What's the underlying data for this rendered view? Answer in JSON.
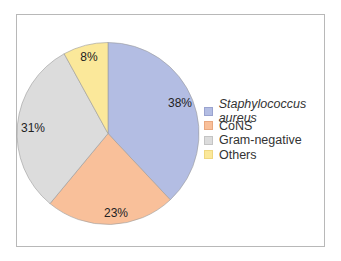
{
  "chart_data": {
    "type": "pie",
    "title": "",
    "categories": [
      "Staphylococcus aureus",
      "CoNS",
      "Gram-negative",
      "Others"
    ],
    "values": [
      38,
      23,
      31,
      8
    ],
    "labels": [
      "38%",
      "23%",
      "31%",
      "8%"
    ],
    "colors": [
      "#b3bde3",
      "#f9c09a",
      "#dcdcdc",
      "#fbe89a"
    ],
    "legend_position": "right",
    "start_angle": "12 o'clock, clockwise"
  },
  "legend": {
    "items": [
      {
        "label": "Staphylococcus aureus",
        "color": "#b3bde3",
        "italic": true
      },
      {
        "label": "CoNS",
        "color": "#f9c09a"
      },
      {
        "label": "Gram-negative",
        "color": "#dcdcdc"
      },
      {
        "label": "Others",
        "color": "#fbe89a"
      }
    ]
  }
}
